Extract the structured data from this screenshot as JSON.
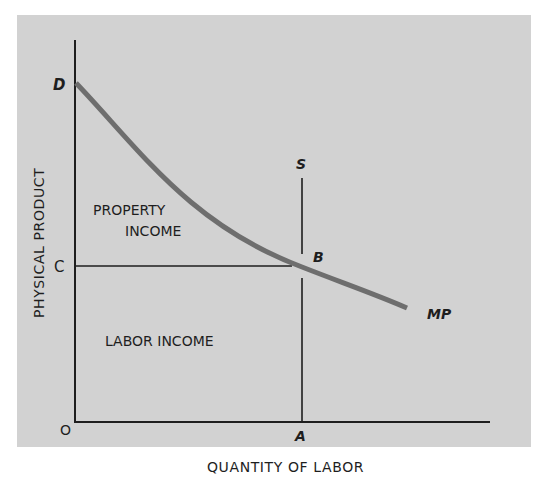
{
  "diagram": {
    "type": "marginal-product-income-distribution",
    "axes": {
      "ylabel": "PHYSICAL PRODUCT",
      "xlabel": "QUANTITY OF LABOR",
      "origin_label": "O"
    },
    "points": {
      "D": "D",
      "C": "C",
      "B": "B",
      "A": "A",
      "S": "S"
    },
    "curve": {
      "label": "MP",
      "color": "#6e6e6e"
    },
    "regions": {
      "upper": [
        "PROPERTY",
        "INCOME"
      ],
      "lower": "LABOR INCOME"
    },
    "colors": {
      "background": "#d2d2d2",
      "lines": "#1e1e1e",
      "curve": "#6e6e6e"
    }
  }
}
